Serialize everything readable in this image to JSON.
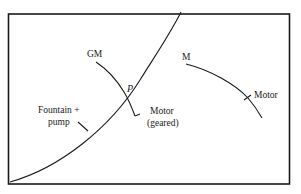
{
  "diagram": {
    "type": "characteristic-curves",
    "labels": {
      "gm": "GM",
      "p": "P",
      "m": "M",
      "motor": "Motor",
      "motor_geared_line1": "Motor",
      "motor_geared_line2": "(geared)",
      "fountain_line1": "Fountain +",
      "fountain_line2": "pump"
    },
    "curves": [
      {
        "name": "Fountain + pump",
        "start_label": "",
        "shape": "rising convex from origin"
      },
      {
        "name": "Motor (geared)",
        "start_label": "GM",
        "shape": "falling, intersects fountain curve at P"
      },
      {
        "name": "Motor",
        "start_label": "M",
        "shape": "falling concave"
      }
    ],
    "intersection": "P",
    "colors": {
      "ink": "#1a1a1a",
      "background": "#ffffff"
    }
  }
}
